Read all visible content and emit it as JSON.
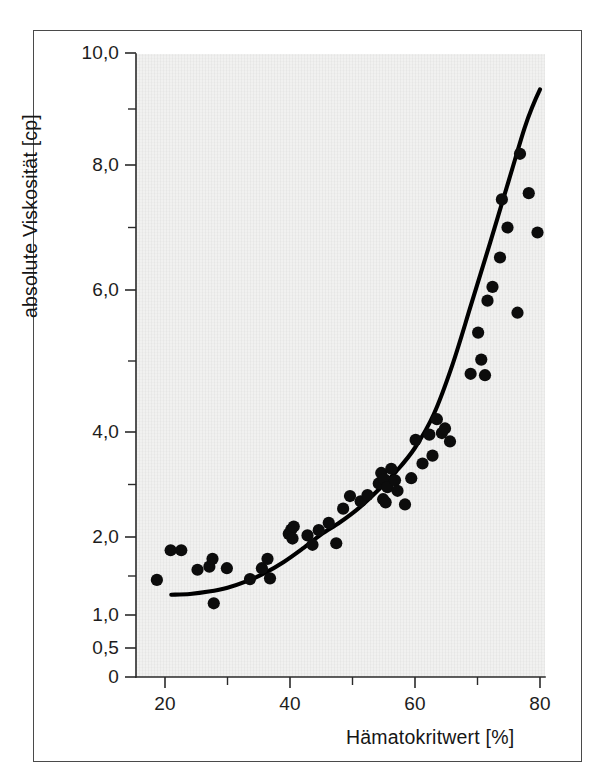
{
  "figure": {
    "kind": "scatter-plot-with-fit",
    "background_color": "#f1f1f0",
    "frame_color": "#4a4a4a",
    "ink_color": "#000000"
  },
  "axes": {
    "y_title": "absolute Viskosität [cp]",
    "x_title": "Hämatokritwert [%]",
    "y_tick_labels": [
      "10,0",
      "8,0",
      "6,0",
      "4,0",
      "2,0",
      "1,0",
      "0,5",
      "0"
    ],
    "x_tick_labels": [
      "20",
      "40",
      "60",
      "80"
    ]
  },
  "chart_data": {
    "type": "scatter",
    "title": "",
    "xlabel": "Hämatokritwert [%]",
    "ylabel": "absolute Viskosität [cp]",
    "xlim": [
      16,
      82
    ],
    "ylim": [
      0,
      10
    ],
    "grid": false,
    "legend": null,
    "x_ticks_major": [
      20,
      40,
      60,
      80
    ],
    "x_ticks_minor": [
      30,
      50,
      70
    ],
    "y_ticks_major": [
      0,
      0.5,
      1.0,
      2.0,
      4.0,
      6.0,
      8.0,
      10.0
    ],
    "y_ticks_minor": [
      1.5,
      3.0,
      5.0,
      7.0,
      9.0
    ],
    "y_scale_note": "Piecewise: compressed below 1,0 (0; 0,5; 1,0), linear above 1,0",
    "series": [
      {
        "name": "Messpunkte",
        "marker": "filled-circle",
        "color": "#0c0c0c",
        "points": [
          [
            18.7,
            1.45
          ],
          [
            20.9,
            1.83
          ],
          [
            22.6,
            1.83
          ],
          [
            25.2,
            1.58
          ],
          [
            27.1,
            1.62
          ],
          [
            27.6,
            1.72
          ],
          [
            27.8,
            1.15
          ],
          [
            29.9,
            1.6
          ],
          [
            33.6,
            1.46
          ],
          [
            35.5,
            1.6
          ],
          [
            36.4,
            1.72
          ],
          [
            36.8,
            1.47
          ],
          [
            39.8,
            2.06
          ],
          [
            40.2,
            2.14
          ],
          [
            40.4,
            1.98
          ],
          [
            40.6,
            2.2
          ],
          [
            42.8,
            2.03
          ],
          [
            43.6,
            1.9
          ],
          [
            44.6,
            2.13
          ],
          [
            46.2,
            2.27
          ],
          [
            47.4,
            1.92
          ],
          [
            48.5,
            2.54
          ],
          [
            49.6,
            2.78
          ],
          [
            51.3,
            2.68
          ],
          [
            52.4,
            2.8
          ],
          [
            54.2,
            3.02
          ],
          [
            54.6,
            3.22
          ],
          [
            54.9,
            2.72
          ],
          [
            55.1,
            3.1
          ],
          [
            55.3,
            2.66
          ],
          [
            55.6,
            2.95
          ],
          [
            56.2,
            3.3
          ],
          [
            56.8,
            3.08
          ],
          [
            57.2,
            2.88
          ],
          [
            58.4,
            2.62
          ],
          [
            59.4,
            3.12
          ],
          [
            60.1,
            3.85
          ],
          [
            61.2,
            3.4
          ],
          [
            62.3,
            3.95
          ],
          [
            62.8,
            3.55
          ],
          [
            63.5,
            4.18
          ],
          [
            64.3,
            3.98
          ],
          [
            64.8,
            4.05
          ],
          [
            65.6,
            3.82
          ],
          [
            68.9,
            4.82
          ],
          [
            70.1,
            5.4
          ],
          [
            70.6,
            5.02
          ],
          [
            71.2,
            4.8
          ],
          [
            71.6,
            5.85
          ],
          [
            72.4,
            6.05
          ],
          [
            73.6,
            6.52
          ],
          [
            73.9,
            7.45
          ],
          [
            74.8,
            7.0
          ],
          [
            76.4,
            5.68
          ],
          [
            76.8,
            8.2
          ],
          [
            78.2,
            7.55
          ],
          [
            79.6,
            6.92
          ]
        ]
      }
    ],
    "fit_curve": {
      "name": "Ausgleichskurve",
      "style": "solid",
      "color": "#000000",
      "points": [
        [
          21.0,
          1.26
        ],
        [
          24.0,
          1.27
        ],
        [
          27.0,
          1.3
        ],
        [
          30.0,
          1.35
        ],
        [
          33.0,
          1.43
        ],
        [
          36.0,
          1.54
        ],
        [
          39.0,
          1.68
        ],
        [
          42.0,
          1.85
        ],
        [
          45.0,
          2.05
        ],
        [
          48.0,
          2.28
        ],
        [
          51.0,
          2.55
        ],
        [
          54.0,
          2.88
        ],
        [
          57.0,
          3.25
        ],
        [
          60.0,
          3.7
        ],
        [
          63.0,
          4.25
        ],
        [
          66.0,
          4.95
        ],
        [
          69.0,
          5.8
        ],
        [
          72.0,
          6.75
        ],
        [
          75.0,
          7.75
        ],
        [
          77.5,
          8.65
        ],
        [
          79.0,
          9.1
        ],
        [
          80.0,
          9.35
        ]
      ]
    }
  }
}
